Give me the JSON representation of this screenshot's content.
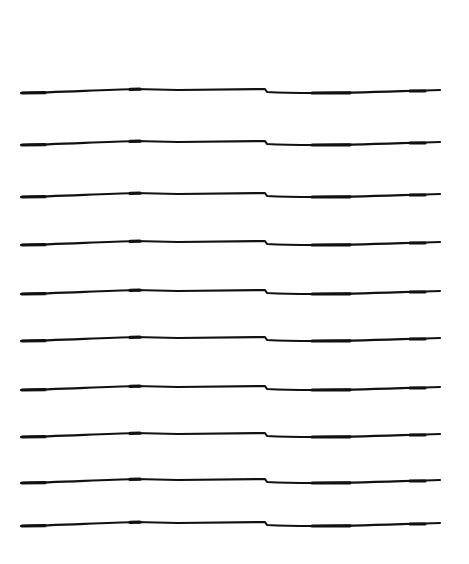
{
  "illustration": {
    "description": "hand-drawn horizontal lines on white background",
    "background": "#ffffff",
    "stroke_color": "#111111",
    "line_count": 10,
    "lines": [
      {
        "y": 90
      },
      {
        "y": 142
      },
      {
        "y": 194
      },
      {
        "y": 242
      },
      {
        "y": 291
      },
      {
        "y": 338
      },
      {
        "y": 387
      },
      {
        "y": 434
      },
      {
        "y": 480
      },
      {
        "y": 523
      }
    ]
  }
}
